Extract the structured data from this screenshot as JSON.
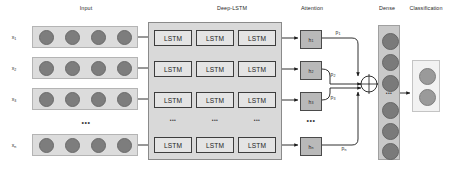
{
  "diagram": {
    "width": 456,
    "height": 169,
    "background": "#ffffff"
  },
  "sections": [
    {
      "id": "input",
      "label": "Input",
      "title_x": 86,
      "title_y": 9
    },
    {
      "id": "deep_lstm",
      "label": "Deep-LSTM",
      "title_x": 232,
      "title_y": 9
    },
    {
      "id": "attention",
      "label": "Attention",
      "title_x": 312,
      "title_y": 9
    },
    {
      "id": "dense",
      "label": "Dense",
      "title_x": 387,
      "title_y": 9
    },
    {
      "id": "classification",
      "label": "Classification",
      "title_x": 426,
      "title_y": 9
    }
  ],
  "input": {
    "rows": [
      {
        "label": "x",
        "sub": "1",
        "y": 37,
        "dots": 4
      },
      {
        "label": "x",
        "sub": "2",
        "y": 68,
        "dots": 4
      },
      {
        "label": "x",
        "sub": "3",
        "y": 99,
        "dots": 4
      },
      {
        "label": "x",
        "sub": "n",
        "y": 145,
        "dots": 4
      }
    ],
    "panel_x": 32,
    "panel_width": 106,
    "panel_height": 22,
    "label_x": 14,
    "ellipsis": {
      "text": "•••",
      "x": 86,
      "y": 122
    }
  },
  "deep_lstm": {
    "panel": {
      "x": 148,
      "y": 22,
      "width": 134,
      "height": 138
    },
    "cell_label": "LSTM",
    "columns_x": [
      154,
      196,
      238
    ],
    "rows_y": [
      30,
      61,
      92,
      137
    ],
    "cell_width": 38,
    "cell_height": 16,
    "column_ellipsis": [
      {
        "x": 173,
        "y": 120,
        "text": "•••"
      },
      {
        "x": 215,
        "y": 120,
        "text": "•••"
      },
      {
        "x": 257,
        "y": 120,
        "text": "•••"
      }
    ]
  },
  "attention": {
    "cells": [
      {
        "label": "h",
        "sub": "1",
        "y": 30
      },
      {
        "label": "h",
        "sub": "2",
        "y": 61
      },
      {
        "label": "h",
        "sub": "3",
        "y": 92
      },
      {
        "label": "h",
        "sub": "n",
        "y": 137
      }
    ],
    "cell_x": 300,
    "cell_width": 22,
    "cell_height": 19,
    "ellipsis": {
      "text": "•••",
      "x": 311,
      "y": 120
    },
    "weights": [
      {
        "label": "p",
        "sub": "1",
        "x": 338,
        "y": 32
      },
      {
        "label": "p",
        "sub": "2",
        "x": 333,
        "y": 74
      },
      {
        "label": "p",
        "sub": "3",
        "x": 333,
        "y": 94
      },
      {
        "label": "p",
        "sub": "n",
        "x": 344,
        "y": 148
      }
    ],
    "sum_node": {
      "cx": 369,
      "cy": 84,
      "r": 8,
      "symbol": "plus-cross"
    }
  },
  "dense": {
    "panel": {
      "x": 378,
      "y": 25,
      "width": 22,
      "height": 135
    },
    "dots_top_y": [
      32,
      55,
      78
    ],
    "dots_bottom_y": [
      105,
      126,
      146
    ],
    "ellipsis": {
      "text": "•••",
      "x": 389,
      "y": 93
    }
  },
  "classification": {
    "panel": {
      "x": 412,
      "y": 60,
      "width": 28,
      "height": 52
    },
    "dots_y": [
      70,
      95
    ],
    "classes": 2
  },
  "colors": {
    "node_fill": "#7d7d7d",
    "input_panel": "#dcdcdc",
    "deep_panel": "#d9d9d9",
    "lstm_fill": "#e4e4e4",
    "attn_fill": "#b9b9b9",
    "dense_panel": "#c9c9c9",
    "class_panel": "#f2f2f2",
    "arrow": "#1a1a1a",
    "text": "#2a2a2a"
  }
}
